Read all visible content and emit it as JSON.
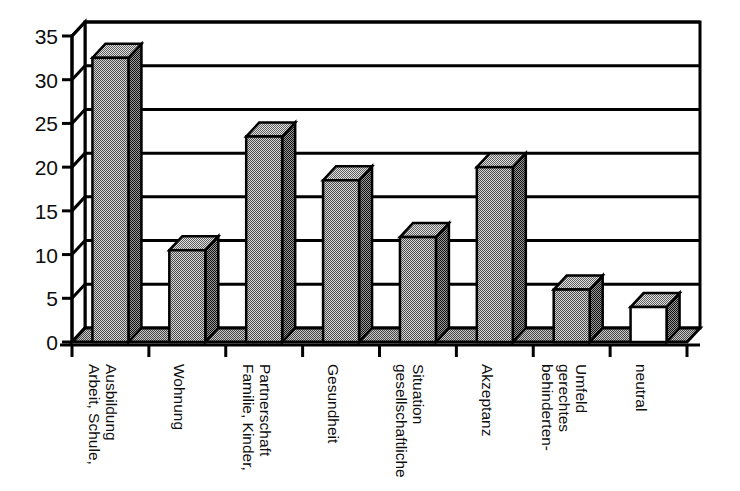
{
  "chart_data": {
    "type": "bar",
    "title": "",
    "subtitle": "",
    "xlabel": "",
    "ylabel": "",
    "ylim": [
      0,
      35
    ],
    "ytick_step": 5,
    "yticks": [
      "0",
      "5",
      "10",
      "15",
      "20",
      "25",
      "30",
      "35"
    ],
    "grid": true,
    "legend": "none",
    "style_3d": true,
    "categories": [
      "Arbeit, Schule, Ausbildung",
      "Wohnung",
      "Familie, Kinder, Partnerschaft",
      "Gesundheit",
      "gesellschaftliche Situation",
      "Akzeptanz",
      "behinderten- gerechtes Umfeld",
      "neutral"
    ],
    "category_lines": [
      [
        "Arbeit, Schule,",
        "Ausbildung"
      ],
      [
        "Wohnung"
      ],
      [
        "Familie, Kinder,",
        "Partnerschaft"
      ],
      [
        "Gesundheit"
      ],
      [
        "gesellschaftliche",
        "Situation"
      ],
      [
        "Akzeptanz"
      ],
      [
        "behinderten-",
        "gerechtes",
        "Umfeld"
      ],
      [
        "neutral"
      ]
    ],
    "values": [
      32.5,
      10.5,
      23.5,
      18.5,
      12,
      20,
      6,
      4
    ],
    "bar_fill": [
      "gray",
      "gray",
      "gray",
      "gray",
      "gray",
      "gray",
      "gray",
      "white"
    ]
  },
  "colors": {
    "bar_front_gray": "#9a9a9a",
    "bar_side_gray": "#5a5a5a",
    "bar_top_gray": "#b4b4b4",
    "bar_front_white": "#ffffff",
    "axis": "#000000",
    "grid": "#000000",
    "background": "#ffffff",
    "floor": "#8f8f8f"
  }
}
